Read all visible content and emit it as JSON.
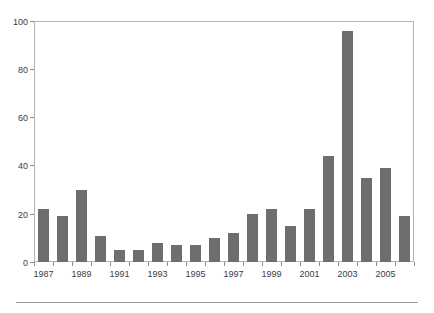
{
  "chart_data": {
    "type": "bar",
    "title": "",
    "subtitle": "",
    "xlabel": "",
    "ylabel": "",
    "categories": [
      "1987",
      "1988",
      "1989",
      "1990",
      "1991",
      "1992",
      "1993",
      "1994",
      "1995",
      "1996",
      "1997",
      "1998",
      "1999",
      "2000",
      "2001",
      "2002",
      "2003",
      "2004",
      "2005",
      "2006"
    ],
    "values": [
      22,
      19,
      30,
      11,
      5,
      5,
      8,
      7,
      7,
      10,
      12,
      20,
      22,
      15,
      22,
      44,
      96,
      35,
      39,
      19
    ],
    "ylim": [
      0,
      100
    ],
    "yticks": [
      0,
      20,
      40,
      60,
      80,
      100
    ],
    "ytick_labels": [
      "0",
      "20",
      "40",
      "60",
      "80",
      "100"
    ],
    "xtick_labels": [
      "1987",
      "1989",
      "1991",
      "1993",
      "1995",
      "1997",
      "1999",
      "2001",
      "2003",
      "2005"
    ],
    "xtick_categories": [
      "1987",
      "1989",
      "1991",
      "1993",
      "1995",
      "1997",
      "1999",
      "2001",
      "2003",
      "2005"
    ],
    "grid": false,
    "legend": null,
    "legend_position": "none",
    "bar_color": "#6e6e6e",
    "frame_color": "#b4b4b4",
    "axis_text_color": "#3c3c3c"
  }
}
